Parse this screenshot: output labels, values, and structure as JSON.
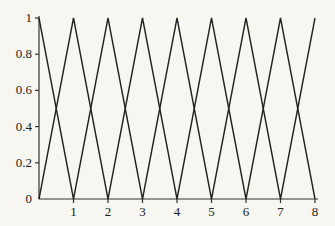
{
  "chart_data": {
    "type": "line",
    "title": "",
    "xlabel": "",
    "ylabel": "",
    "xlim": [
      0,
      8
    ],
    "ylim": [
      0,
      1
    ],
    "grid": false,
    "legend": null,
    "x_ticks": [
      "1",
      "2",
      "3",
      "4",
      "5",
      "6",
      "7",
      "8"
    ],
    "y_ticks": [
      "0",
      "0.2",
      "0.4",
      "0.6",
      "0.8",
      "1"
    ],
    "origin_label": "0",
    "series": [
      {
        "name": "zigzag-even-peaks",
        "x": [
          0,
          1,
          2,
          3,
          4,
          5,
          6,
          7,
          8
        ],
        "values": [
          1,
          0,
          1,
          0,
          1,
          0,
          1,
          0,
          1
        ]
      },
      {
        "name": "zigzag-odd-peaks",
        "x": [
          0,
          1,
          2,
          3,
          4,
          5,
          6,
          7,
          8
        ],
        "values": [
          0,
          1,
          0,
          1,
          0,
          1,
          0,
          1,
          0
        ]
      }
    ],
    "colors": {
      "line": "#222222",
      "axis": "#333333",
      "background": "#f7f6f0"
    }
  }
}
